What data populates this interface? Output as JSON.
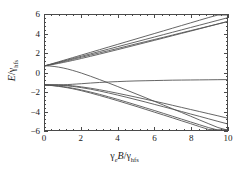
{
  "chart_data": {
    "type": "line",
    "title": "",
    "subtitle": "",
    "xlabel_parts": {
      "gamma": "γ",
      "gamma_sub": "e",
      "var": "B",
      "slash": "/",
      "gamma2": "γ",
      "gamma2_sub": "hfs"
    },
    "ylabel_parts": {
      "var": "E",
      "slash": "/",
      "gamma": "γ",
      "gamma_sub": "hfs"
    },
    "xlabel": "γ_e B/γ_hfs",
    "ylabel": "E/γ_hfs",
    "xlim": [
      0,
      10
    ],
    "ylim": [
      -6,
      6
    ],
    "xticks": [
      0,
      2,
      4,
      6,
      8,
      10
    ],
    "yticks": [
      -6,
      -4,
      -2,
      0,
      2,
      4,
      6
    ],
    "xticklabels": [
      "0",
      "2",
      "4",
      "6",
      "8",
      "10"
    ],
    "yticklabels": [
      "−6",
      "−4",
      "−2",
      "0",
      "2",
      "4",
      "6"
    ],
    "xminor_count": 4,
    "yminor_count": 4,
    "grid": false,
    "legend": null,
    "line_color": "#555555",
    "frame_color": "#4a4a4a",
    "x": [
      0,
      0.25,
      0.5,
      0.75,
      1,
      1.25,
      1.5,
      1.75,
      2,
      2.5,
      3,
      3.5,
      4,
      4.5,
      5,
      5.5,
      6,
      6.5,
      7,
      7.5,
      8,
      8.5,
      9,
      9.5,
      10
    ],
    "series": [
      {
        "name": "upper-1",
        "values": [
          0.7,
          0.84,
          0.98,
          1.12,
          1.26,
          1.4,
          1.54,
          1.68,
          1.82,
          2.1,
          2.38,
          2.66,
          2.94,
          3.22,
          3.5,
          3.78,
          4.06,
          4.34,
          4.62,
          4.9,
          5.18,
          5.46,
          5.74,
          6.02,
          6.3
        ]
      },
      {
        "name": "upper-2",
        "values": [
          0.7,
          0.82,
          0.945,
          1.07,
          1.195,
          1.32,
          1.445,
          1.57,
          1.695,
          1.945,
          2.195,
          2.445,
          2.695,
          2.945,
          3.195,
          3.445,
          3.695,
          3.945,
          4.195,
          4.445,
          4.695,
          4.945,
          5.195,
          5.445,
          5.695
        ]
      },
      {
        "name": "upper-3",
        "values": [
          0.7,
          0.8,
          0.91,
          1.02,
          1.13,
          1.245,
          1.36,
          1.475,
          1.59,
          1.82,
          2.05,
          2.28,
          2.51,
          2.745,
          2.98,
          3.21,
          3.44,
          3.67,
          3.905,
          4.14,
          4.37,
          4.6,
          4.835,
          5.07,
          5.3
        ]
      },
      {
        "name": "upper-4",
        "values": [
          0.7,
          0.775,
          0.86,
          0.95,
          1.045,
          1.145,
          1.25,
          1.355,
          1.465,
          1.69,
          1.92,
          2.155,
          2.39,
          2.63,
          2.87,
          3.11,
          3.35,
          3.59,
          3.835,
          4.08,
          4.32,
          4.565,
          4.81,
          5.055,
          5.3
        ]
      },
      {
        "name": "upper-5-curving-down",
        "values": [
          0.7,
          0.68,
          0.63,
          0.56,
          0.47,
          0.36,
          0.23,
          0.09,
          -0.06,
          -0.39,
          -0.74,
          -1.1,
          -1.47,
          -1.85,
          -2.23,
          -2.61,
          -3.0,
          -3.39,
          -3.78,
          -4.17,
          -4.56,
          -4.96,
          -5.35,
          -5.74,
          -6.0
        ]
      },
      {
        "name": "lower-1-curving-up",
        "values": [
          -1.3,
          -1.3,
          -1.3,
          -1.29,
          -1.28,
          -1.26,
          -1.23,
          -1.2,
          -1.17,
          -1.1,
          -1.04,
          -0.99,
          -0.95,
          -0.91,
          -0.88,
          -0.86,
          -0.84,
          -0.82,
          -0.8,
          -0.79,
          -0.78,
          -0.77,
          -0.76,
          -0.75,
          -0.74
        ]
      },
      {
        "name": "lower-2",
        "values": [
          -1.3,
          -1.33,
          -1.37,
          -1.42,
          -1.48,
          -1.55,
          -1.63,
          -1.72,
          -1.82,
          -2.04,
          -2.28,
          -2.54,
          -2.81,
          -3.09,
          -3.38,
          -3.67,
          -3.96,
          -4.26,
          -4.56,
          -4.86,
          -5.16,
          -5.46,
          -5.76,
          -6.0,
          -6.0
        ]
      },
      {
        "name": "lower-3",
        "values": [
          -1.3,
          -1.34,
          -1.39,
          -1.45,
          -1.52,
          -1.6,
          -1.69,
          -1.79,
          -1.9,
          -2.14,
          -2.4,
          -2.67,
          -2.95,
          -3.24,
          -3.53,
          -3.83,
          -4.13,
          -4.43,
          -4.73,
          -5.04,
          -5.34,
          -5.65,
          -5.95,
          -6.0,
          -6.0
        ]
      },
      {
        "name": "lower-4",
        "values": [
          -1.3,
          -1.3,
          -1.31,
          -1.33,
          -1.36,
          -1.4,
          -1.45,
          -1.51,
          -1.58,
          -1.74,
          -1.93,
          -2.14,
          -2.36,
          -2.59,
          -2.83,
          -3.07,
          -3.32,
          -3.57,
          -3.82,
          -4.07,
          -4.33,
          -4.58,
          -4.84,
          -5.1,
          -5.35
        ]
      },
      {
        "name": "lower-5",
        "values": [
          -1.3,
          -1.29,
          -1.29,
          -1.3,
          -1.32,
          -1.35,
          -1.39,
          -1.44,
          -1.5,
          -1.64,
          -1.8,
          -1.98,
          -2.17,
          -2.37,
          -2.57,
          -2.78,
          -2.99,
          -3.2,
          -3.42,
          -3.64,
          -3.86,
          -4.08,
          -4.3,
          -4.52,
          -4.75
        ]
      }
    ]
  }
}
